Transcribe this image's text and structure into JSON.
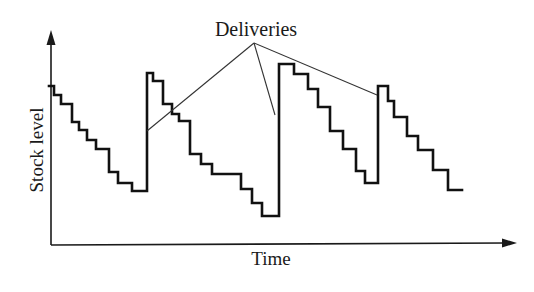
{
  "annotation": {
    "text": "Deliveries"
  },
  "axes": {
    "y_label": "Stock level",
    "x_label": "Time"
  },
  "colors": {
    "line": "#111111",
    "axis": "#1a1a1a",
    "pointer": "#333333",
    "background": "#ffffff"
  },
  "chart_data": {
    "type": "line",
    "title": "",
    "xlabel": "Time",
    "ylabel": "Stock level",
    "grid": false,
    "legend": null,
    "annotations": [
      {
        "text": "Deliveries",
        "points_to": [
          "delivery 1",
          "delivery 2",
          "delivery 3"
        ]
      }
    ],
    "pixel_polyline": [
      [
        49,
        86
      ],
      [
        54,
        86
      ],
      [
        54,
        95
      ],
      [
        61,
        95
      ],
      [
        61,
        104
      ],
      [
        72,
        104
      ],
      [
        72,
        122
      ],
      [
        79,
        122
      ],
      [
        79,
        130
      ],
      [
        87,
        130
      ],
      [
        87,
        140
      ],
      [
        96,
        140
      ],
      [
        96,
        149
      ],
      [
        109,
        149
      ],
      [
        109,
        172
      ],
      [
        118,
        172
      ],
      [
        118,
        183
      ],
      [
        132,
        183
      ],
      [
        132,
        191
      ],
      [
        147,
        191
      ],
      [
        147,
        73
      ],
      [
        153,
        73
      ],
      [
        153,
        81
      ],
      [
        163,
        81
      ],
      [
        163,
        104
      ],
      [
        172,
        104
      ],
      [
        172,
        114
      ],
      [
        179,
        114
      ],
      [
        179,
        121
      ],
      [
        190,
        121
      ],
      [
        190,
        154
      ],
      [
        201,
        154
      ],
      [
        201,
        164
      ],
      [
        212,
        164
      ],
      [
        212,
        174
      ],
      [
        241,
        174
      ],
      [
        241,
        189
      ],
      [
        252,
        189
      ],
      [
        252,
        203
      ],
      [
        262,
        203
      ],
      [
        262,
        216
      ],
      [
        279,
        216
      ],
      [
        279,
        64
      ],
      [
        294,
        64
      ],
      [
        294,
        74
      ],
      [
        308,
        74
      ],
      [
        308,
        89
      ],
      [
        318,
        89
      ],
      [
        318,
        107
      ],
      [
        330,
        107
      ],
      [
        330,
        131
      ],
      [
        343,
        131
      ],
      [
        343,
        149
      ],
      [
        356,
        149
      ],
      [
        356,
        171
      ],
      [
        365,
        171
      ],
      [
        365,
        183
      ],
      [
        378,
        183
      ],
      [
        378,
        86
      ],
      [
        388,
        86
      ],
      [
        388,
        101
      ],
      [
        394,
        101
      ],
      [
        394,
        117
      ],
      [
        407,
        117
      ],
      [
        407,
        136
      ],
      [
        418,
        136
      ],
      [
        418,
        150
      ],
      [
        433,
        150
      ],
      [
        433,
        170
      ],
      [
        448,
        170
      ],
      [
        448,
        190
      ],
      [
        462,
        190
      ]
    ],
    "delivery_points": [
      [
        147,
        131
      ],
      [
        275,
        115
      ],
      [
        377,
        95
      ]
    ],
    "annotation_apex": [
      254,
      43
    ]
  }
}
